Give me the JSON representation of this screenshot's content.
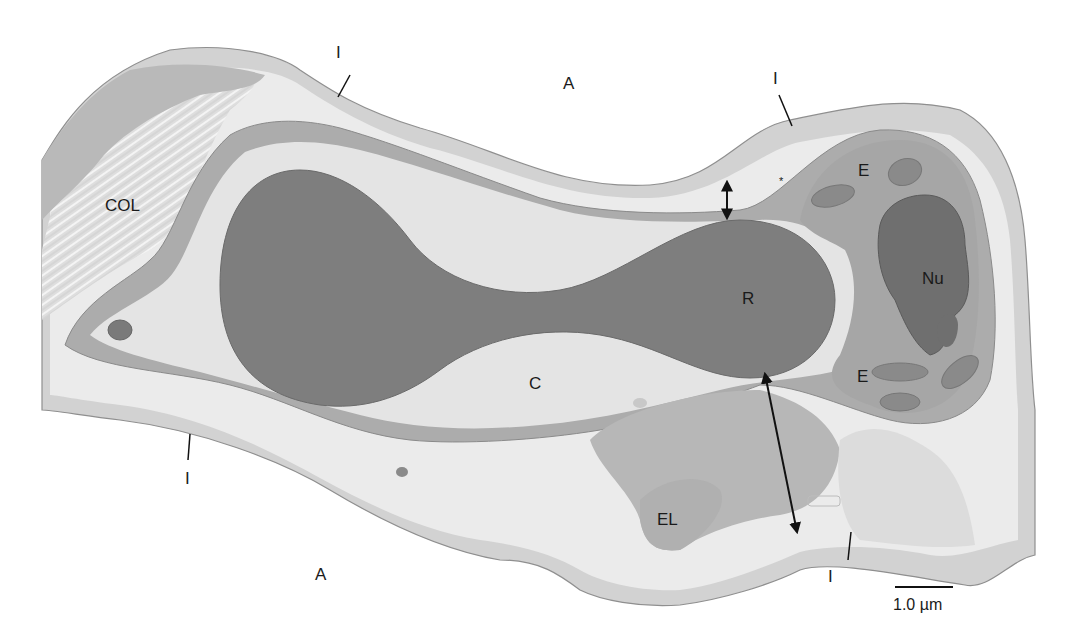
{
  "figure": {
    "type": "electron-micrograph-tracing",
    "colors": {
      "background": "#ffffff",
      "interstitium_outer": "#d2d2d2",
      "pale_layer": "#e9e9e9",
      "endothelium": "#a9a9a9",
      "capillary_lumen": "#e4e4e4",
      "red_cell": "#7d7d7d",
      "nucleus": "#6e6e6e",
      "collagen": "#d9d9d9",
      "elastin": "#b8b8b8",
      "outline": "#8a8a8a",
      "text": "#1a1a1a"
    }
  },
  "labels": {
    "alveolus_top": "A",
    "alveolus_bottom": "A",
    "interstitium_top_left": "I",
    "interstitium_top_right": "I",
    "interstitium_bottom_left": "I",
    "interstitium_bottom_right": "I",
    "collagen": "COL",
    "red_cell": "R",
    "capillary": "C",
    "endothelium_top": "E",
    "endothelium_bottom": "E",
    "nucleus": "Nu",
    "elastin": "EL",
    "asterisk": "*"
  },
  "scale_bar": {
    "label": "1.0 µm",
    "length_px": 58
  },
  "annotations": {
    "thin_side_arrow": "double-headed arrow (thin barrier)",
    "thick_side_arrow": "double-headed arrow (thick barrier)"
  }
}
